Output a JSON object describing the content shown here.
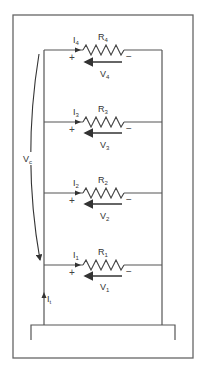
{
  "diagram": {
    "type": "parallel-resistor-circuit",
    "colors": {
      "line": "#555555",
      "text": "#333333",
      "background": "#ffffff"
    },
    "source_voltage": {
      "label": "V",
      "sub": "c",
      "arrow": "curved-down"
    },
    "source_current": {
      "label": "I",
      "sub": "t",
      "arrow": "up"
    },
    "branches": [
      {
        "resistor": {
          "label": "R",
          "sub": "4"
        },
        "current": {
          "label": "I",
          "sub": "4"
        },
        "voltage": {
          "label": "V",
          "sub": "4"
        },
        "plus": "+",
        "minus": "−"
      },
      {
        "resistor": {
          "label": "R",
          "sub": "3"
        },
        "current": {
          "label": "I",
          "sub": "3"
        },
        "voltage": {
          "label": "V",
          "sub": "3"
        },
        "plus": "+",
        "minus": "−"
      },
      {
        "resistor": {
          "label": "R",
          "sub": "2"
        },
        "current": {
          "label": "I",
          "sub": "2"
        },
        "voltage": {
          "label": "V",
          "sub": "2"
        },
        "plus": "+",
        "minus": "−"
      },
      {
        "resistor": {
          "label": "R",
          "sub": "1"
        },
        "current": {
          "label": "I",
          "sub": "1"
        },
        "voltage": {
          "label": "V",
          "sub": "1"
        },
        "plus": "+",
        "minus": "−"
      }
    ]
  }
}
